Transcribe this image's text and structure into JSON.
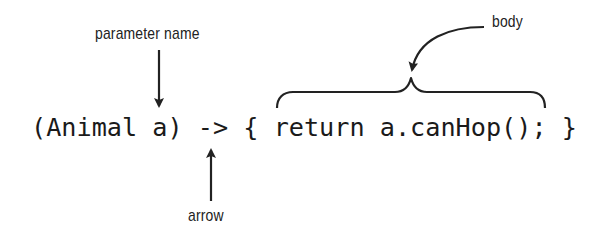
{
  "diagram": {
    "code": "(Animal a) -> { return a.canHop(); }",
    "labels": {
      "parameter_name": "parameter name",
      "body": "body",
      "arrow": "arrow"
    },
    "colors": {
      "text": "#1a1a1a",
      "lines": "#222222",
      "background": "#ffffff"
    }
  }
}
